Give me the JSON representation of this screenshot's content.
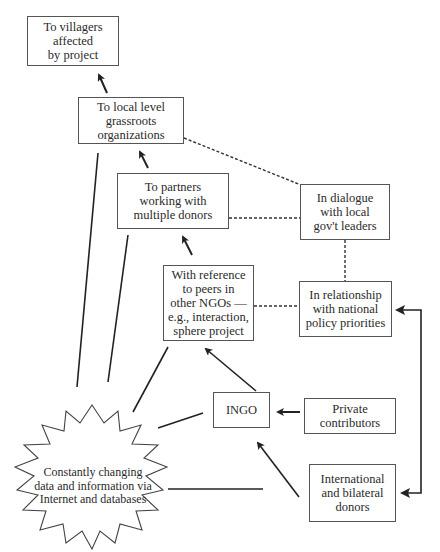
{
  "diagram": {
    "type": "flow-diagram",
    "nodes": {
      "villagers": {
        "label": "To villagers\naffected\nby project"
      },
      "grassroots": {
        "label": "To local level\ngrassroots\norganizations"
      },
      "partners": {
        "label": "To partners\nworking with\nmultiple donors"
      },
      "dialogue": {
        "label": "In dialogue\nwith local\ngov't leaders"
      },
      "peers": {
        "label": "With reference\nto peers in\nother NGOs —\ne.g., interaction,\nsphere project"
      },
      "relationship": {
        "label": "In relationship\nwith national\npolicy priorities"
      },
      "ingo": {
        "label": "INGO"
      },
      "private": {
        "label": "Private\ncontributors"
      },
      "donors": {
        "label": "International\nand bilateral\ndonors"
      },
      "data_cloud": {
        "label": "Constantly changing\ndata and information via\nInternet and databases"
      }
    },
    "edges": [
      {
        "from": "grassroots",
        "to": "villagers",
        "style": "solid-arrow"
      },
      {
        "from": "partners",
        "to": "grassroots",
        "style": "solid-arrow"
      },
      {
        "from": "peers",
        "to": "partners",
        "style": "solid-arrow"
      },
      {
        "from": "ingo",
        "to": "peers",
        "style": "solid-arrow"
      },
      {
        "from": "private",
        "to": "ingo",
        "style": "solid-arrow"
      },
      {
        "from": "donors",
        "to": "ingo",
        "style": "solid-arrow"
      },
      {
        "from": "donors",
        "to": "relationship",
        "style": "bidirectional-elbow-arrow"
      },
      {
        "from": "grassroots",
        "to": "dialogue",
        "style": "dashed"
      },
      {
        "from": "partners",
        "to": "dialogue",
        "style": "dashed"
      },
      {
        "from": "dialogue",
        "to": "relationship",
        "style": "dashed"
      },
      {
        "from": "peers",
        "to": "relationship",
        "style": "dashed"
      },
      {
        "from": "data_cloud",
        "to": "grassroots",
        "style": "solid-line"
      },
      {
        "from": "data_cloud",
        "to": "partners",
        "style": "solid-line"
      },
      {
        "from": "data_cloud",
        "to": "peers",
        "style": "solid-line"
      },
      {
        "from": "data_cloud",
        "to": "ingo",
        "style": "solid-line"
      },
      {
        "from": "data_cloud",
        "to": "donors",
        "style": "solid-line"
      }
    ],
    "colors": {
      "line": "#333333",
      "border": "#555555",
      "background": "#ffffff"
    }
  }
}
